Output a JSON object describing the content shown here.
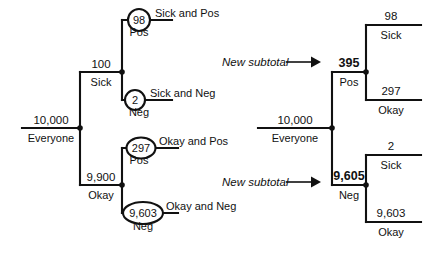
{
  "figure": {
    "background": "#ffffff",
    "ink": "#111111"
  },
  "left_tree": {
    "root": {
      "value": "10,000",
      "label": "Everyone"
    },
    "branches": [
      {
        "value": "100",
        "label": "Sick"
      },
      {
        "value": "9,900",
        "label": "Okay"
      }
    ],
    "leaves": [
      {
        "circled": "98",
        "label": "Pos",
        "outcome": "Sick and Pos"
      },
      {
        "circled": "2",
        "label": "Neg",
        "outcome": "Sick and Neg"
      },
      {
        "circled": "297",
        "label": "Pos",
        "outcome": "Okay and Pos"
      },
      {
        "circled": "9,603",
        "label": "Neg",
        "outcome": "Okay and Neg"
      }
    ]
  },
  "right_tree": {
    "root": {
      "value": "10,000",
      "label": "Everyone"
    },
    "annotations": [
      {
        "text": "New subtotal",
        "target": "395"
      },
      {
        "text": "New subtotal",
        "target": "9,605"
      }
    ],
    "branches": [
      {
        "value": "395",
        "label": "Pos"
      },
      {
        "value": "9,605",
        "label": "Neg"
      }
    ],
    "leaves": [
      {
        "value": "98",
        "label": "Sick"
      },
      {
        "value": "297",
        "label": "Okay"
      },
      {
        "value": "2",
        "label": "Sick"
      },
      {
        "value": "9,603",
        "label": "Okay"
      }
    ]
  }
}
